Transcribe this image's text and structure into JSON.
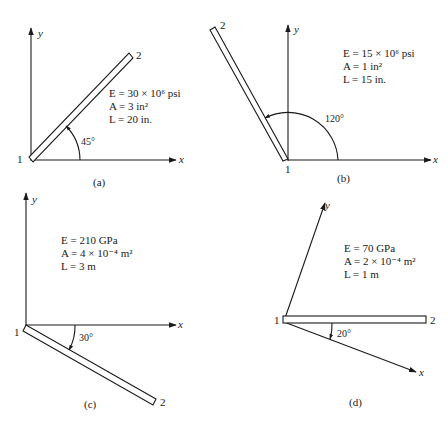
{
  "figure": {
    "panels": [
      {
        "id": "a",
        "caption": "(a)",
        "properties": {
          "E": "E = 30 × 10⁶ psi",
          "A": "A = 3 in²",
          "L": "L = 20 in."
        },
        "angle_label": "45°",
        "node1": "1",
        "node2": "2",
        "x_label": "x",
        "y_label": "y"
      },
      {
        "id": "b",
        "caption": "(b)",
        "properties": {
          "E": "E = 15 × 10⁶ psi",
          "A": "A = 1 in²",
          "L": "L = 15 in."
        },
        "angle_label": "120°",
        "node1": "1",
        "node2": "2",
        "x_label": "x",
        "y_label": "y"
      },
      {
        "id": "c",
        "caption": "(c)",
        "properties": {
          "E": "E = 210 GPa",
          "A": "A = 4 × 10⁻⁴ m²",
          "L": "L = 3 m"
        },
        "angle_label": "30°",
        "node1": "1",
        "node2": "2",
        "x_label": "x",
        "y_label": "y"
      },
      {
        "id": "d",
        "caption": "(d)",
        "properties": {
          "E": "E = 70 GPa",
          "A": "A = 2 × 10⁻⁴ m²",
          "L": "L = 1 m"
        },
        "angle_label": "20°",
        "node1": "1",
        "node2": "2",
        "x_label": "x",
        "y_label": "y"
      }
    ]
  }
}
